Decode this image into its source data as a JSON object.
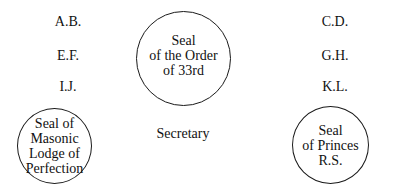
{
  "left_column": [
    {
      "label": "A.B."
    },
    {
      "label": "E.F."
    },
    {
      "label": "I.J."
    }
  ],
  "right_column": [
    {
      "label": "C.D."
    },
    {
      "label": "G.H."
    },
    {
      "label": "K.L."
    }
  ],
  "seals": {
    "order": {
      "lines": [
        "Seal",
        "of the Order",
        "of 33rd"
      ]
    },
    "lodge": {
      "lines": [
        "Seal of",
        "Masonic",
        "Lodge of",
        "Perfection"
      ]
    },
    "princes": {
      "lines": [
        "Seal",
        "of Princes",
        "R.S."
      ]
    }
  },
  "secretary": {
    "label": "Secretary"
  }
}
